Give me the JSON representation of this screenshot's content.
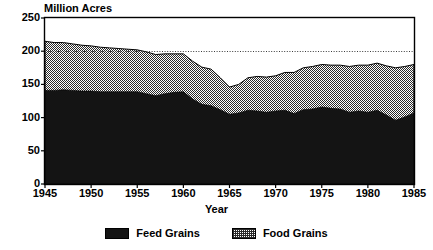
{
  "chart_data": {
    "type": "area",
    "stacked": true,
    "title": "",
    "xlabel": "Year",
    "ylabel": "Million Acres",
    "ylim": [
      0,
      250
    ],
    "xlim": [
      1945,
      1985
    ],
    "yticks": [
      0,
      50,
      100,
      150,
      200,
      250
    ],
    "xticks": [
      1945,
      1950,
      1955,
      1960,
      1965,
      1970,
      1975,
      1980,
      1985
    ],
    "grid": "dotted-horizontal-at-200",
    "legend_position": "bottom-center",
    "x": [
      1945,
      1946,
      1947,
      1948,
      1949,
      1950,
      1951,
      1952,
      1953,
      1954,
      1955,
      1956,
      1957,
      1958,
      1959,
      1960,
      1961,
      1962,
      1963,
      1964,
      1965,
      1966,
      1967,
      1968,
      1969,
      1970,
      1971,
      1972,
      1973,
      1974,
      1975,
      1976,
      1977,
      1978,
      1979,
      1980,
      1981,
      1982,
      1983,
      1984,
      1985
    ],
    "series": [
      {
        "name": "Feed Grains",
        "color": "#141414",
        "pattern": "solid-black",
        "values": [
          141,
          141,
          142,
          141,
          140,
          140,
          139,
          139,
          139,
          139,
          139,
          136,
          133,
          136,
          138,
          139,
          128,
          120,
          118,
          112,
          105,
          107,
          111,
          110,
          108,
          110,
          111,
          106,
          112,
          113,
          116,
          114,
          113,
          108,
          110,
          108,
          111,
          104,
          96,
          101,
          107
        ]
      },
      {
        "name": "Food Grains",
        "color": "#9a9a9a",
        "pattern": "checkerboard-hatch",
        "values": [
          74,
          72,
          71,
          70,
          69,
          68,
          67,
          66,
          65,
          64,
          63,
          63,
          62,
          60,
          58,
          57,
          57,
          56,
          55,
          48,
          41,
          43,
          49,
          52,
          53,
          53,
          57,
          62,
          63,
          64,
          64,
          65,
          66,
          69,
          69,
          71,
          71,
          74,
          79,
          76,
          73
        ]
      }
    ],
    "totals": [
      215,
      213,
      213,
      211,
      209,
      208,
      206,
      205,
      204,
      203,
      202,
      199,
      195,
      196,
      196,
      196,
      185,
      176,
      173,
      160,
      146,
      150,
      160,
      162,
      161,
      163,
      168,
      168,
      175,
      177,
      180,
      179,
      179,
      177,
      179,
      179,
      182,
      178,
      175,
      177,
      180
    ]
  },
  "axis": {
    "y_title": "Million Acres",
    "x_title": "Year",
    "y_tick_labels": [
      "250",
      "200",
      "150",
      "100",
      "50",
      "0"
    ],
    "x_tick_labels": [
      "1945",
      "1950",
      "1955",
      "1960",
      "1965",
      "1970",
      "1975",
      "1980",
      "1985"
    ]
  },
  "legend": {
    "items": [
      {
        "label": "Feed Grains",
        "swatch": "solid-black-swatch"
      },
      {
        "label": "Food Grains",
        "swatch": "hatched-gray-swatch"
      }
    ]
  }
}
